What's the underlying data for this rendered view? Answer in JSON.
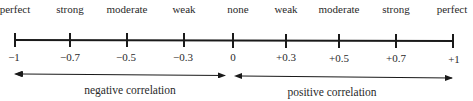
{
  "diagram": {
    "type": "number-line",
    "axis": {
      "min": -1,
      "max": 1,
      "color": "#1a1a1a"
    },
    "ticks": [
      {
        "value": -1,
        "label": "−1",
        "strength": "perfect",
        "x": 15
      },
      {
        "value": -0.7,
        "label": "−0.7",
        "strength": "strong",
        "x": 70
      },
      {
        "value": -0.5,
        "label": "−0.5",
        "strength": "moderate",
        "x": 127
      },
      {
        "value": -0.3,
        "label": "−0.3",
        "strength": "weak",
        "x": 184
      },
      {
        "value": 0,
        "label": "0",
        "strength": "none",
        "x": 233
      },
      {
        "value": 0.3,
        "label": "+0.3",
        "strength": "weak",
        "x": 286
      },
      {
        "value": 0.5,
        "label": "+0.5",
        "strength": "moderate",
        "x": 339
      },
      {
        "value": 0.7,
        "label": "+0.7",
        "strength": "strong",
        "x": 396
      },
      {
        "value": 1,
        "label": "+1",
        "strength": "perfect",
        "x": 453
      }
    ],
    "ranges": [
      {
        "label": "negative correlation",
        "from": -1,
        "to": 0
      },
      {
        "label": "positive correlation",
        "from": 0,
        "to": 1
      }
    ]
  }
}
